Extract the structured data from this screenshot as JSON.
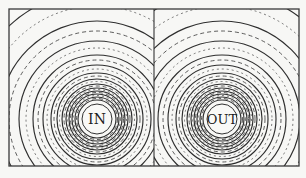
{
  "figure": {
    "left_conductor": {
      "label": "IN",
      "cx": 97,
      "cy": 119
    },
    "right_conductor": {
      "label": "OUT",
      "cx": 222,
      "cy": 119
    },
    "frame": {
      "x": 9,
      "y": 9,
      "width": 290,
      "height": 157
    },
    "core_radius": 15,
    "solid_radii": [
      19,
      22,
      25,
      28,
      31,
      35,
      40,
      46,
      54,
      64,
      78,
      98,
      128
    ],
    "dashed_radii": [
      20.5,
      23.5,
      26.5,
      29.5,
      33,
      37.5,
      43,
      50,
      59,
      71,
      88,
      113,
      145
    ],
    "colors": {
      "ink": "#2e2e2e",
      "paper": "#f7f7f5"
    }
  }
}
